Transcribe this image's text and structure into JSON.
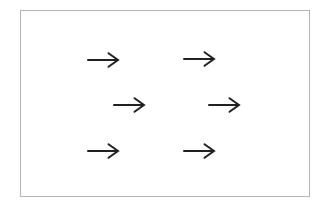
{
  "figure": {
    "type": "vector-field-diagram",
    "background_color": "#ffffff",
    "frame": {
      "left": 20,
      "top": 10,
      "width": 290,
      "height": 187,
      "border_color": "#b4b4b4",
      "fill": "#ffffff"
    },
    "arrow_style": {
      "glyph": "→",
      "direction": "right",
      "color": "#212121",
      "stroke_width": 2,
      "length": 31,
      "head_depth": 10,
      "head_height": 14
    },
    "arrows": [
      {
        "row": 1,
        "col": 1,
        "cx": 102,
        "cy": 59
      },
      {
        "row": 1,
        "col": 2,
        "cx": 198,
        "cy": 58
      },
      {
        "row": 2,
        "col": 1,
        "cx": 128,
        "cy": 104
      },
      {
        "row": 2,
        "col": 2,
        "cx": 223,
        "cy": 104
      },
      {
        "row": 3,
        "col": 1,
        "cx": 102,
        "cy": 150
      },
      {
        "row": 3,
        "col": 2,
        "cx": 198,
        "cy": 150
      }
    ]
  }
}
